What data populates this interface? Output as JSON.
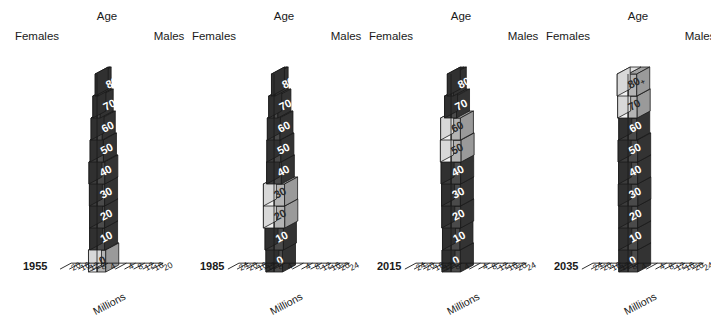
{
  "figure": {
    "background_color": "#ffffff",
    "panel_count": 4
  },
  "labels": {
    "age": "Age",
    "females": "Females",
    "males": "Males",
    "millions": "Millions"
  },
  "colors": {
    "dark_front": "#3c3c3c",
    "dark_top": "#2a2a2a",
    "dark_side": "#303030",
    "male_dark_front": "#4a4a4a",
    "male_dark_top": "#343434",
    "light_front": "#f2f2f2",
    "light_top": "#e2e2e2",
    "light_side": "#d8d8d8",
    "male_light_front": "#b4b4b4",
    "male_light_top": "#a0a0a0",
    "outline": "#1a1a1a",
    "text_dark": "#1a1a1a",
    "text_on_dark": "#ffffff"
  },
  "chart_data": {
    "type": "bar",
    "title": "",
    "subtitle": "",
    "xlabel": "Millions",
    "ylabel": "Age",
    "grid": false,
    "legend_position": "none",
    "age_bands": [
      "0",
      "10",
      "20",
      "30",
      "40",
      "50",
      "60",
      "70",
      "80+"
    ],
    "age_band_display": [
      "0",
      "10",
      "20",
      "30",
      "40",
      "50",
      "60",
      "70",
      "80+"
    ],
    "sides": [
      "Females",
      "Males"
    ],
    "panels": [
      {
        "year": "1955",
        "axis": {
          "female_ticks": [
            20,
            16,
            12,
            8,
            4
          ],
          "male_ticks": [
            4,
            8,
            12,
            16,
            20
          ],
          "female_tick_labels": [
            "20",
            "16",
            "12",
            "8",
            "4"
          ],
          "male_tick_labels": [
            "4",
            "8",
            "12",
            "16",
            "20"
          ],
          "max": 20,
          "unit": "Millions"
        },
        "series": [
          {
            "name": "Females",
            "values": [
              3.7,
              3.2,
              3.2,
              3.3,
              3.5,
              3.0,
              2.6,
              1.8,
              0.8
            ]
          },
          {
            "name": "Males",
            "values": [
              3.8,
              3.3,
              3.3,
              3.3,
              3.4,
              2.8,
              2.3,
              1.4,
              0.5
            ]
          }
        ],
        "highlight_bands": [
          "0"
        ]
      },
      {
        "year": "1985",
        "axis": {
          "female_ticks": [
            24,
            20,
            16,
            12,
            8,
            4
          ],
          "male_ticks": [
            4,
            8,
            12,
            16,
            20,
            24
          ],
          "female_tick_labels": [
            "24",
            "20",
            "16",
            "12",
            "8",
            "4"
          ],
          "male_tick_labels": [
            "4",
            "8",
            "12",
            "16",
            "20",
            "24"
          ],
          "max": 24,
          "unit": "Millions"
        },
        "series": [
          {
            "name": "Females",
            "values": [
              3.5,
              3.9,
              4.6,
              4.6,
              3.2,
              3.1,
              2.9,
              2.3,
              1.1
            ]
          },
          {
            "name": "Males",
            "values": [
              3.7,
              4.1,
              4.7,
              4.6,
              3.2,
              3.0,
              2.6,
              1.7,
              0.5
            ]
          }
        ],
        "highlight_bands": [
          "20",
          "30"
        ]
      },
      {
        "year": "2015",
        "axis": {
          "female_ticks": [
            24,
            20,
            16,
            12,
            8,
            4
          ],
          "male_ticks": [
            4,
            8,
            12,
            16,
            20,
            24
          ],
          "female_tick_labels": [
            "24",
            "20",
            "16",
            "12",
            "8",
            "4"
          ],
          "male_tick_labels": [
            "4",
            "8",
            "12",
            "16",
            "20",
            "24"
          ],
          "max": 24,
          "unit": "Millions"
        },
        "series": [
          {
            "name": "Females",
            "values": [
              3.9,
              3.7,
              4.0,
              4.1,
              4.3,
              4.6,
              4.5,
              2.8,
              1.6
            ]
          },
          {
            "name": "Males",
            "values": [
              4.1,
              3.9,
              4.2,
              4.1,
              4.2,
              4.4,
              4.1,
              2.4,
              1.0
            ]
          }
        ],
        "highlight_bands": [
          "50",
          "60"
        ]
      },
      {
        "year": "2035",
        "axis": {
          "female_ticks": [
            24,
            20,
            16,
            12,
            8,
            4
          ],
          "male_ticks": [
            4,
            8,
            12,
            16,
            20,
            24
          ],
          "female_tick_labels": [
            "24",
            "20",
            "16",
            "12",
            "8",
            "4"
          ],
          "male_tick_labels": [
            "4",
            "8",
            "12",
            "16",
            "20",
            "24"
          ],
          "max": 24,
          "unit": "Millions"
        },
        "series": [
          {
            "name": "Females",
            "values": [
              4.0,
              4.0,
              4.0,
              4.2,
              4.1,
              4.3,
              4.0,
              4.5,
              4.7
            ]
          },
          {
            "name": "Males",
            "values": [
              4.2,
              4.2,
              4.2,
              4.3,
              4.2,
              4.2,
              3.8,
              4.0,
              3.8
            ]
          }
        ],
        "highlight_bands": [
          "70",
          "80+"
        ]
      }
    ]
  }
}
